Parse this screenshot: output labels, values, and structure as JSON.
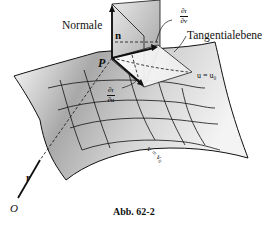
{
  "figure": {
    "caption": "Abb. 62-2",
    "labels": {
      "normal": "Normale",
      "tangent_plane": "Tangentialebene",
      "normal_vector": "n",
      "point": "P",
      "u_curve": "u = u₀",
      "v_curve": "v = v₀",
      "position_vector": "r",
      "origin": "O"
    },
    "partials": {
      "dr_dv": {
        "num": "∂r",
        "den": "∂v"
      },
      "dr_du": {
        "num": "∂r",
        "den": "∂u"
      }
    },
    "colors": {
      "ink": "#111111",
      "surface_shade": "#9a9a9a",
      "plane_shade": "#c8c8c8",
      "background": "#ffffff"
    }
  }
}
